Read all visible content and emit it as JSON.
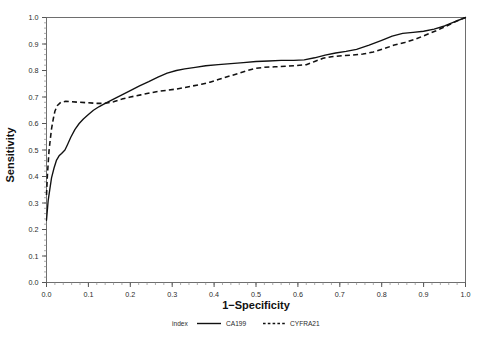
{
  "chart_data": {
    "type": "line",
    "title": "",
    "xlabel": "1−Specificity",
    "ylabel": "Sensitivity",
    "xlim": [
      0.0,
      1.0
    ],
    "ylim": [
      0.0,
      1.0
    ],
    "grid": false,
    "legend_position": "bottom",
    "legend_title": "index",
    "x_ticks": [
      "0.0",
      "0.1",
      "0.2",
      "0.3",
      "0.4",
      "0.5",
      "0.6",
      "0.7",
      "0.8",
      "0.9",
      "1.0"
    ],
    "y_ticks": [
      "0.0",
      "0.1",
      "0.2",
      "0.3",
      "0.4",
      "0.5",
      "0.6",
      "0.7",
      "0.8",
      "0.9",
      "1.0"
    ],
    "x_tick_values": [
      0.0,
      0.1,
      0.2,
      0.3,
      0.4,
      0.5,
      0.6,
      0.7,
      0.8,
      0.9,
      1.0
    ],
    "y_tick_values": [
      0.0,
      0.1,
      0.2,
      0.3,
      0.4,
      0.5,
      0.6,
      0.7,
      0.8,
      0.9,
      1.0
    ],
    "minor_tick_step": 0.02,
    "series": [
      {
        "name": "CA199",
        "style": "solid",
        "color": "#111111",
        "points": [
          [
            0.0,
            0.235
          ],
          [
            0.004,
            0.31
          ],
          [
            0.008,
            0.352
          ],
          [
            0.012,
            0.395
          ],
          [
            0.018,
            0.432
          ],
          [
            0.024,
            0.462
          ],
          [
            0.03,
            0.478
          ],
          [
            0.036,
            0.487
          ],
          [
            0.044,
            0.5
          ],
          [
            0.05,
            0.52
          ],
          [
            0.058,
            0.548
          ],
          [
            0.068,
            0.578
          ],
          [
            0.078,
            0.6
          ],
          [
            0.088,
            0.617
          ],
          [
            0.1,
            0.634
          ],
          [
            0.112,
            0.65
          ],
          [
            0.126,
            0.664
          ],
          [
            0.14,
            0.676
          ],
          [
            0.16,
            0.692
          ],
          [
            0.18,
            0.708
          ],
          [
            0.2,
            0.724
          ],
          [
            0.222,
            0.742
          ],
          [
            0.244,
            0.758
          ],
          [
            0.266,
            0.775
          ],
          [
            0.288,
            0.79
          ],
          [
            0.31,
            0.8
          ],
          [
            0.33,
            0.806
          ],
          [
            0.355,
            0.812
          ],
          [
            0.38,
            0.818
          ],
          [
            0.41,
            0.822
          ],
          [
            0.44,
            0.826
          ],
          [
            0.47,
            0.83
          ],
          [
            0.5,
            0.834
          ],
          [
            0.53,
            0.836
          ],
          [
            0.56,
            0.838
          ],
          [
            0.59,
            0.838
          ],
          [
            0.615,
            0.84
          ],
          [
            0.64,
            0.848
          ],
          [
            0.665,
            0.858
          ],
          [
            0.69,
            0.866
          ],
          [
            0.715,
            0.872
          ],
          [
            0.74,
            0.88
          ],
          [
            0.77,
            0.896
          ],
          [
            0.8,
            0.914
          ],
          [
            0.825,
            0.93
          ],
          [
            0.85,
            0.94
          ],
          [
            0.875,
            0.944
          ],
          [
            0.9,
            0.948
          ],
          [
            0.925,
            0.956
          ],
          [
            0.95,
            0.968
          ],
          [
            0.975,
            0.984
          ],
          [
            1.0,
            1.0
          ]
        ]
      },
      {
        "name": "CYFRA21",
        "style": "dashed",
        "color": "#111111",
        "points": [
          [
            0.0,
            0.33
          ],
          [
            0.002,
            0.4
          ],
          [
            0.004,
            0.45
          ],
          [
            0.006,
            0.496
          ],
          [
            0.009,
            0.54
          ],
          [
            0.012,
            0.58
          ],
          [
            0.016,
            0.616
          ],
          [
            0.02,
            0.646
          ],
          [
            0.026,
            0.668
          ],
          [
            0.034,
            0.68
          ],
          [
            0.046,
            0.684
          ],
          [
            0.06,
            0.682
          ],
          [
            0.08,
            0.68
          ],
          [
            0.1,
            0.678
          ],
          [
            0.12,
            0.676
          ],
          [
            0.14,
            0.676
          ],
          [
            0.16,
            0.682
          ],
          [
            0.18,
            0.692
          ],
          [
            0.2,
            0.7
          ],
          [
            0.225,
            0.708
          ],
          [
            0.25,
            0.716
          ],
          [
            0.27,
            0.722
          ],
          [
            0.29,
            0.726
          ],
          [
            0.31,
            0.73
          ],
          [
            0.33,
            0.736
          ],
          [
            0.35,
            0.742
          ],
          [
            0.37,
            0.748
          ],
          [
            0.39,
            0.756
          ],
          [
            0.41,
            0.766
          ],
          [
            0.435,
            0.778
          ],
          [
            0.46,
            0.79
          ],
          [
            0.48,
            0.8
          ],
          [
            0.5,
            0.808
          ],
          [
            0.52,
            0.812
          ],
          [
            0.545,
            0.814
          ],
          [
            0.57,
            0.816
          ],
          [
            0.595,
            0.818
          ],
          [
            0.62,
            0.822
          ],
          [
            0.64,
            0.834
          ],
          [
            0.66,
            0.846
          ],
          [
            0.68,
            0.852
          ],
          [
            0.705,
            0.856
          ],
          [
            0.73,
            0.858
          ],
          [
            0.755,
            0.862
          ],
          [
            0.78,
            0.87
          ],
          [
            0.805,
            0.882
          ],
          [
            0.83,
            0.896
          ],
          [
            0.855,
            0.906
          ],
          [
            0.88,
            0.918
          ],
          [
            0.905,
            0.934
          ],
          [
            0.93,
            0.95
          ],
          [
            0.955,
            0.968
          ],
          [
            0.978,
            0.986
          ],
          [
            1.0,
            1.0
          ]
        ]
      }
    ]
  }
}
